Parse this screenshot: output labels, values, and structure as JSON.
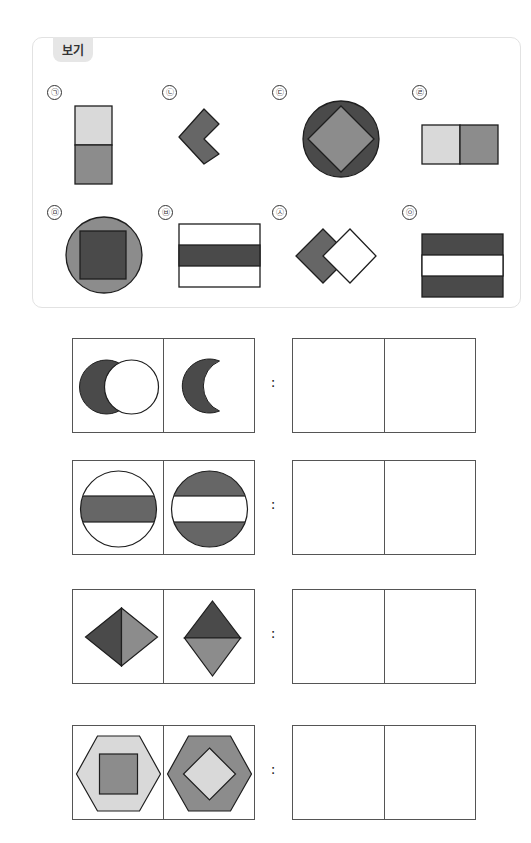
{
  "example_box": {
    "title": "보기",
    "choices": [
      {
        "label": "㉠",
        "figure": "vertical-two-squares-light-over-medium"
      },
      {
        "label": "㉡",
        "figure": "chevron-left-dark"
      },
      {
        "label": "㉢",
        "figure": "dark-circle-with-medium-diamond"
      },
      {
        "label": "㉣",
        "figure": "horizontal-two-squares-light-left-medium-right"
      },
      {
        "label": "㉤",
        "figure": "medium-circle-with-dark-square"
      },
      {
        "label": "㉥",
        "figure": "white-rectangle-with-dark-middle-band"
      },
      {
        "label": "㉦",
        "figure": "overlapping-diamonds-dark-and-white"
      },
      {
        "label": "㉧",
        "figure": "dark-rectangle-with-white-middle-band"
      }
    ]
  },
  "questions": [
    {
      "given": [
        "overlapping-circles-dark-left-white-right",
        "dark-crescent"
      ],
      "separator": ":",
      "answer": [
        "",
        ""
      ]
    },
    {
      "given": [
        "white-circle-with-dark-band",
        "dark-circle-with-white-band"
      ],
      "separator": ":",
      "answer": [
        "",
        ""
      ]
    },
    {
      "given": [
        "diamond-split-vertical-dark-left-medium-right",
        "diamond-split-horizontal-dark-top-medium-bottom"
      ],
      "separator": ":",
      "answer": [
        "",
        ""
      ]
    },
    {
      "given": [
        "light-hexagon-with-medium-square",
        "medium-hexagon-with-light-diamond"
      ],
      "separator": ":",
      "answer": [
        "",
        ""
      ]
    }
  ],
  "colors": {
    "dark": "#4a4a4a",
    "medium": "#8c8c8c",
    "light": "#d9d9d9",
    "white": "#ffffff",
    "stroke": "#1e1e1e"
  }
}
